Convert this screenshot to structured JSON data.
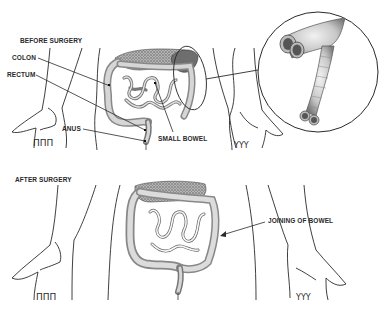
{
  "diagram": {
    "panels": [
      {
        "id": "before",
        "title": "BEFORE SURGERY",
        "labels": [
          {
            "id": "colon",
            "text": "COLON"
          },
          {
            "id": "rectum",
            "text": "RECTUM"
          },
          {
            "id": "anus",
            "text": "ANUS"
          },
          {
            "id": "small-bowel",
            "text": "SMALL BOWEL"
          }
        ],
        "inset": "magnified view of diseased bowel segment"
      },
      {
        "id": "after",
        "title": "AFTER SURGERY",
        "labels": [
          {
            "id": "joining",
            "text": "JOINING OF BOWEL"
          }
        ]
      }
    ]
  },
  "colors": {
    "background": "#ffffff",
    "line": "#2a2a2a",
    "bowel_fill": "#cfcfcf",
    "bowel_shade": "#8a8a8a",
    "omentum": "#9a9a9a",
    "diseased": "#6e6e6e"
  }
}
